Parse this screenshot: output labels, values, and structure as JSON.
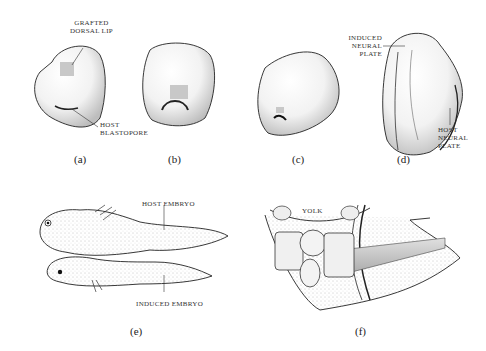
{
  "figure": {
    "panels": [
      {
        "id": "a",
        "label": "(a)",
        "annotations": [
          "GRAFTED DORSAL LIP",
          "HOST BLASTOPORE"
        ]
      },
      {
        "id": "b",
        "label": "(b)",
        "annotations": []
      },
      {
        "id": "c",
        "label": "(c)",
        "annotations": []
      },
      {
        "id": "d",
        "label": "(d)",
        "annotations": [
          "INDUCED NEURAL PLATE",
          "HOST NEURAL PLATE"
        ]
      },
      {
        "id": "e",
        "label": "(e)",
        "annotations": [
          "HOST EMBRYO",
          "INDUCED EMBRYO"
        ]
      },
      {
        "id": "f",
        "label": "(f)",
        "annotations": [
          "YOLK"
        ]
      }
    ],
    "text": {
      "grafted_1": "GRAFTED",
      "grafted_2": "DORSAL LIP",
      "host_blast_1": "HOST",
      "host_blast_2": "BLASTOPORE",
      "induced_np_1": "INDUCED",
      "induced_np_2": "NEURAL",
      "induced_np_3": "PLATE",
      "host_np_1": "HOST",
      "host_np_2": "NEURAL",
      "host_np_3": "PLATE",
      "host_embryo": "HOST EMBRYO",
      "induced_embryo": "INDUCED EMBRYO",
      "yolk": "YOLK"
    },
    "colors": {
      "ink": "#222222",
      "stipple": "#9a9a9a",
      "graft": "#c8c8c8"
    }
  }
}
